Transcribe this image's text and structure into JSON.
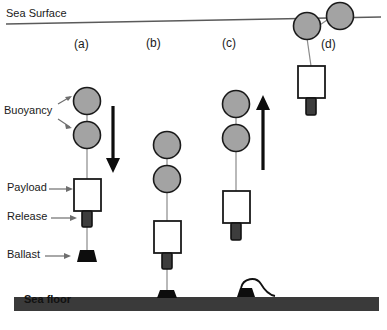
{
  "figure": {
    "title_visible": false,
    "annotations": {
      "sea_surface": "Sea Surface",
      "sea_floor": "Sea floor",
      "buoyancy": "Buoyancy",
      "payload": "Payload",
      "release": "Release",
      "ballast": "Ballast"
    },
    "panels": [
      {
        "key": "a",
        "label": "(a)",
        "caption_x": 85,
        "motion": "descending"
      },
      {
        "key": "b",
        "label": "(b)",
        "caption_x": 155,
        "motion": "landed"
      },
      {
        "key": "c",
        "label": "(c)",
        "caption_x": 231,
        "motion": "ascending"
      },
      {
        "key": "d",
        "label": "(d)",
        "caption_x": 330,
        "motion": "at-surface"
      }
    ],
    "colors": {
      "sphere_fill": "#a3a3a3",
      "sphere_stroke": "#1a1a1a",
      "payload_fill": "#ffffff",
      "payload_stroke": "#1a1a1a",
      "release_fill": "#3d3d3d",
      "release_stroke": "#111111",
      "ballast_fill": "#0d0d0d",
      "seafloor_fill": "#3a3a3a",
      "line_stroke": "#808080",
      "arrow_fill": "#0d0d0d",
      "surface_line": "#5a5a5a",
      "text": "#1a1a1a"
    },
    "arrows": [
      {
        "panel": "a",
        "direction": "down",
        "x": 113,
        "y_top": 108,
        "y_bottom": 172
      },
      {
        "panel": "c",
        "direction": "up",
        "x": 263,
        "y_top": 96,
        "y_bottom": 170
      }
    ]
  }
}
